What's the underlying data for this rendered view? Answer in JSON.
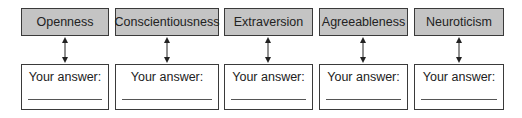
{
  "diagram": {
    "traits": [
      {
        "label": "Openness",
        "answer_label": "Your answer:",
        "answer_value": ""
      },
      {
        "label": "Conscientiousness",
        "answer_label": "Your answer:",
        "answer_value": ""
      },
      {
        "label": "Extraversion",
        "answer_label": "Your answer:",
        "answer_value": ""
      },
      {
        "label": "Agreeableness",
        "answer_label": "Your answer:",
        "answer_value": ""
      },
      {
        "label": "Neuroticism",
        "answer_label": "Your answer:",
        "answer_value": ""
      }
    ],
    "colors": {
      "trait_fill": "#c4c4c4",
      "border": "#3a3a3a",
      "answer_fill": "#ffffff"
    }
  }
}
